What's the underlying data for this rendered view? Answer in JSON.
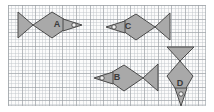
{
  "figure": {
    "title": "",
    "background": "#fbfbfb",
    "grid": {
      "minor_color": "#bec3c8",
      "major_color": "#969ba0",
      "minor_spacing_px": 3.4,
      "major_spacing_px": 13.6,
      "frame": {
        "x": 8,
        "y": 5,
        "width": 198,
        "height": 101
      }
    },
    "shape_style": {
      "fill": "#a9a9a9",
      "stroke": "#4a4a4a",
      "eye_fill": "#f2f2f2",
      "eye_stroke": "#3a3a3a",
      "label_color": "#3a3a3a"
    }
  },
  "shapes": [
    {
      "id": "fish-a",
      "label": "A",
      "direction": "right",
      "label_position": {
        "x": 57,
        "y": 25
      },
      "tail_points": "18,12 18,38 33,25",
      "body_points": "33,25 52,12 72,24 52,38",
      "nose_points": "63,19 82,25 63,31",
      "eye": {
        "cx": 74,
        "cy": 25,
        "r": 2.2
      }
    },
    {
      "id": "fish-c",
      "label": "C",
      "direction": "left",
      "label_position": {
        "x": 128,
        "y": 27
      },
      "tail_points": "170,13 170,40 155,27",
      "body_points": "155,27 136,14 116,26 136,40",
      "nose_points": "125,21 106,27 125,33",
      "eye": {
        "cx": 114,
        "cy": 27,
        "r": 2.2
      }
    },
    {
      "id": "fish-b",
      "label": "B",
      "direction": "left",
      "label_position": {
        "x": 117,
        "y": 78
      },
      "tail_points": "158,64 158,91 143,78",
      "body_points": "143,78 124,65 104,77 124,91",
      "nose_points": "113,72 94,78 113,84",
      "eye": {
        "cx": 102,
        "cy": 78,
        "r": 2.2
      }
    },
    {
      "id": "fish-d",
      "label": "D",
      "direction": "down",
      "label_position": {
        "x": 180,
        "y": 84
      },
      "tail_points": "167,47 194,47 180,61",
      "body_points": "180,61 193,76 181,97 167,76",
      "nose_points": "175,88 181,106 187,88",
      "eye": {
        "cx": 181,
        "cy": 94,
        "r": 2.2
      }
    }
  ]
}
